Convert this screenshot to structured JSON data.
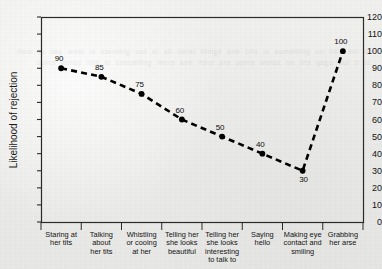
{
  "chart_data": {
    "type": "line",
    "title": "",
    "subtitle": "",
    "xlabel": "",
    "ylabel": "Likelihood of rejection",
    "ylim": [
      0,
      120
    ],
    "ytick_step": 10,
    "yticks": [
      "0",
      "10",
      "20",
      "30",
      "40",
      "50",
      "60",
      "70",
      "80",
      "90",
      "100",
      "110",
      "120"
    ],
    "grid": false,
    "legend": "none",
    "line_style": "dashed",
    "marker": "filled-circle",
    "series_color": "#000000",
    "categories": [
      "Staring at her tits",
      "Talking about her tits",
      "Whistling or cooing at her",
      "Telling her she looks beautiful",
      "Telling her she looks interesting to talk to",
      "Saying hello",
      "Making eye contact and smiling",
      "Grabbing her arse"
    ],
    "category_lines": [
      [
        "Staring at",
        "her tits"
      ],
      [
        "Talking",
        "about",
        "her tits"
      ],
      [
        "Whistling",
        "or cooing",
        "at her"
      ],
      [
        "Telling her",
        "she looks",
        "beautiful"
      ],
      [
        "Telling her",
        "she looks",
        "interesting",
        "to talk to"
      ],
      [
        "Saying",
        "hello"
      ],
      [
        "Making eye",
        "contact and",
        "smiling"
      ],
      [
        "Grabbing",
        "her arse"
      ]
    ],
    "values": [
      90,
      85,
      75,
      60,
      50,
      40,
      30,
      100
    ],
    "point_labels": [
      "90",
      "85",
      "75",
      "60",
      "50",
      "40",
      "30",
      "100"
    ],
    "point_label_position": [
      "above",
      "above",
      "above",
      "above",
      "above",
      "above",
      "below",
      "above"
    ]
  },
  "bleed_text": "la the eiht no gnihtemos si siht dna sgniht rehto lla fo tuo gnidnats si tahw yas ot drah si ti tub egap eht no sdrow emos era ereh dna erom gnihtemos si siht sdrow emos"
}
